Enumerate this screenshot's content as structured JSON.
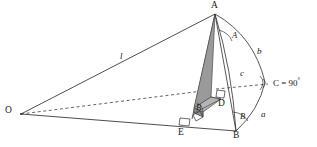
{
  "figure": {
    "background_color": "#ffffff",
    "stroke_color": "#3a3a3a",
    "shade_fill": "#9a9a9a",
    "shade_fill_light": "#b4b4b4",
    "width": 317,
    "height": 147
  },
  "vertices": {
    "apex": "A",
    "origin": "O",
    "base_right": "B",
    "foot_d": "D",
    "foot_e": "E"
  },
  "sides": {
    "a": "a",
    "b": "b",
    "c": "c",
    "slant": "l"
  },
  "angles": {
    "angle_a": "A",
    "angle_b_arc": "B",
    "angle_b_inner": "B",
    "angle_c": "C = 90",
    "angle_c_value": "90",
    "angle_c_prefix": "C = ",
    "degree_symbol": "°"
  },
  "markers": {
    "right_angle_d": "right-angle",
    "right_angle_e": "right-angle",
    "right_angle_e2": "right-angle"
  }
}
